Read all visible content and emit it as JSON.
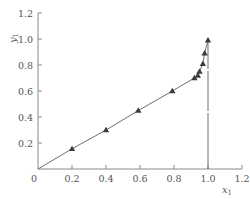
{
  "chart_data": {
    "type": "line",
    "title": "",
    "xlabel": "x1",
    "ylabel": "y1",
    "xlim": [
      0,
      1.2
    ],
    "ylim": [
      0,
      1.2
    ],
    "grid": false,
    "legend": null,
    "x_ticks": [
      0.2,
      0.4,
      0.6,
      0.8,
      1.0,
      1.2
    ],
    "x_tick_labels": [
      "0.2",
      "0.4",
      "0.6",
      "0.8",
      "1.0",
      "1.2"
    ],
    "y_ticks": [
      0.2,
      0.4,
      0.6,
      0.8,
      1.0,
      1.2
    ],
    "y_tick_labels": [
      "0.2",
      "0.4",
      "0.6",
      "0.8",
      "1.0",
      "1.2"
    ],
    "origin_label": "0",
    "series": [
      {
        "name": "equilibrium data",
        "marker": "triangle",
        "line": "solid",
        "x": [
          0.0,
          0.2,
          0.4,
          0.59,
          0.79,
          0.92,
          0.94,
          0.95,
          0.97,
          0.98,
          1.0
        ],
        "y": [
          0.0,
          0.155,
          0.3,
          0.45,
          0.6,
          0.7,
          0.72,
          0.75,
          0.81,
          0.89,
          0.99
        ],
        "markers_at": [
          1,
          2,
          3,
          4,
          5,
          6,
          7,
          8,
          9,
          10
        ]
      }
    ],
    "annotations": [
      {
        "type": "vertical-line",
        "x": 1.0,
        "y_from": 0.0,
        "y_to": 0.99,
        "style": "solid-with-gaps"
      }
    ]
  },
  "colors": {
    "axis": "#8a8a8a",
    "line": "#6e6e6e",
    "marker": "#3c3c3c",
    "text": "#555555"
  }
}
